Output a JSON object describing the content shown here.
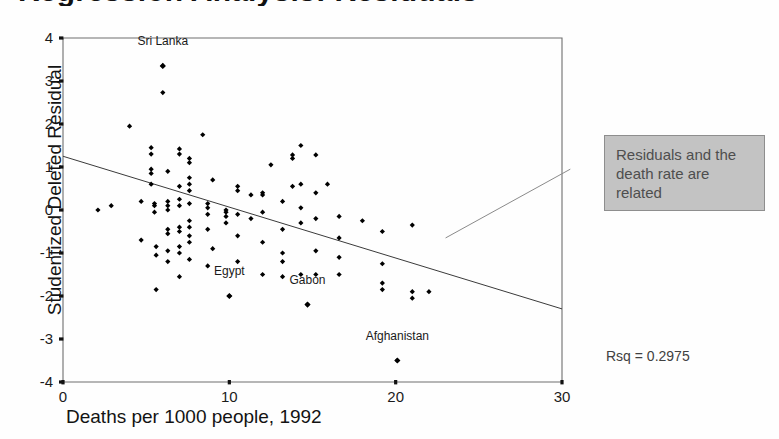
{
  "clipped_title": "Regression Analysis: Residuals",
  "axes": {
    "y_title": "Studentized Deleted Residual",
    "x_title": "Deaths per 1000 people, 1992",
    "y_ticks": [
      "4",
      "3",
      "2",
      "1",
      "0",
      "-1",
      "-2",
      "-3",
      "-4"
    ],
    "x_ticks": [
      "0",
      "10",
      "20",
      "30"
    ]
  },
  "callout": {
    "line1": "Residuals and the",
    "line2": "death rate are",
    "line3": "related",
    "bg_color": "#c3c3c3",
    "text_color": "#4e4e4e"
  },
  "statistics": {
    "rsq_label": "Rsq = 0.2975"
  },
  "chart_data": {
    "type": "scatter",
    "title": "",
    "xlabel": "Deaths per 1000 people, 1992",
    "ylabel": "Studentized Deleted Residual",
    "xlim": [
      0,
      30
    ],
    "ylim": [
      -4,
      4
    ],
    "xticks": [
      0,
      10,
      20,
      30
    ],
    "yticks": [
      -4,
      -3,
      -2,
      -1,
      0,
      1,
      2,
      3,
      4
    ],
    "grid": false,
    "legend": null,
    "marker": "diamond",
    "marker_color": "#000000",
    "marker_size": 4,
    "r_squared": 0.2975,
    "regression_line": {
      "x": [
        0,
        30
      ],
      "y": [
        1.25,
        -2.3
      ],
      "color": "#3a3a3a",
      "width": 1
    },
    "annotations": [
      {
        "text": "Sri Lanka",
        "x": 6.0,
        "y": 3.35,
        "dy": 0.55
      },
      {
        "text": "Egypt",
        "x": 10.0,
        "y": -2.0,
        "dy": 0.55
      },
      {
        "text": "Gabon",
        "x": 14.7,
        "y": -2.2,
        "dy": 0.55
      },
      {
        "text": "Afghanistan",
        "x": 20.1,
        "y": -3.5,
        "dy": 0.55
      }
    ],
    "callout_leader": {
      "x0": 23.0,
      "y0": -0.65,
      "x1": 30.5,
      "y1": 0.95
    },
    "points": [
      [
        2.1,
        0.0
      ],
      [
        2.9,
        0.1
      ],
      [
        4.0,
        1.95
      ],
      [
        4.7,
        0.2
      ],
      [
        4.7,
        -0.7
      ],
      [
        5.3,
        1.45
      ],
      [
        5.3,
        1.3
      ],
      [
        5.3,
        0.95
      ],
      [
        5.3,
        0.85
      ],
      [
        5.3,
        0.6
      ],
      [
        5.5,
        0.15
      ],
      [
        5.5,
        0.1
      ],
      [
        5.5,
        -0.05
      ],
      [
        5.6,
        -0.85
      ],
      [
        5.6,
        -1.05
      ],
      [
        5.6,
        -1.85
      ],
      [
        6.0,
        3.35
      ],
      [
        6.0,
        2.73
      ],
      [
        6.3,
        0.9
      ],
      [
        6.3,
        0.2
      ],
      [
        6.3,
        0.1
      ],
      [
        6.3,
        0.0
      ],
      [
        6.3,
        -0.45
      ],
      [
        6.3,
        -0.55
      ],
      [
        6.3,
        -0.95
      ],
      [
        6.3,
        -1.2
      ],
      [
        7.0,
        1.42
      ],
      [
        7.0,
        1.3
      ],
      [
        7.0,
        0.55
      ],
      [
        7.0,
        0.25
      ],
      [
        7.0,
        0.1
      ],
      [
        7.0,
        -0.4
      ],
      [
        7.0,
        -0.5
      ],
      [
        7.0,
        -0.85
      ],
      [
        7.0,
        -1.0
      ],
      [
        7.0,
        -1.55
      ],
      [
        7.6,
        1.2
      ],
      [
        7.6,
        1.1
      ],
      [
        7.6,
        0.75
      ],
      [
        7.6,
        0.6
      ],
      [
        7.6,
        0.45
      ],
      [
        7.6,
        0.15
      ],
      [
        7.6,
        -0.25
      ],
      [
        7.6,
        -0.4
      ],
      [
        7.6,
        -0.6
      ],
      [
        7.6,
        -0.75
      ],
      [
        7.6,
        -1.15
      ],
      [
        8.4,
        1.75
      ],
      [
        8.7,
        0.15
      ],
      [
        8.7,
        0.05
      ],
      [
        8.7,
        -0.1
      ],
      [
        8.7,
        -0.45
      ],
      [
        8.7,
        -1.3
      ],
      [
        9.0,
        0.7
      ],
      [
        9.0,
        -0.9
      ],
      [
        9.8,
        0.0
      ],
      [
        9.8,
        -0.05
      ],
      [
        9.8,
        -0.15
      ],
      [
        9.8,
        -0.3
      ],
      [
        10.0,
        -2.0
      ],
      [
        10.5,
        0.55
      ],
      [
        10.5,
        0.45
      ],
      [
        10.5,
        -0.1
      ],
      [
        10.5,
        -0.6
      ],
      [
        10.5,
        -1.2
      ],
      [
        11.3,
        0.35
      ],
      [
        11.3,
        -0.2
      ],
      [
        12.0,
        0.4
      ],
      [
        12.0,
        0.35
      ],
      [
        12.0,
        -0.05
      ],
      [
        12.0,
        -0.75
      ],
      [
        12.0,
        -1.5
      ],
      [
        12.5,
        1.05
      ],
      [
        13.2,
        0.2
      ],
      [
        13.2,
        -0.45
      ],
      [
        13.2,
        -1.0
      ],
      [
        13.2,
        -1.2
      ],
      [
        13.2,
        -1.55
      ],
      [
        13.8,
        1.28
      ],
      [
        13.8,
        1.2
      ],
      [
        13.8,
        0.55
      ],
      [
        14.3,
        1.5
      ],
      [
        14.3,
        0.6
      ],
      [
        14.3,
        0.05
      ],
      [
        14.3,
        -0.3
      ],
      [
        14.3,
        -1.5
      ],
      [
        14.7,
        -2.2
      ],
      [
        15.2,
        1.28
      ],
      [
        15.2,
        0.4
      ],
      [
        15.2,
        -0.2
      ],
      [
        15.2,
        -0.95
      ],
      [
        15.2,
        -1.5
      ],
      [
        15.9,
        0.6
      ],
      [
        16.6,
        -0.15
      ],
      [
        16.6,
        -0.65
      ],
      [
        16.6,
        -1.1
      ],
      [
        16.6,
        -1.5
      ],
      [
        18.0,
        -0.25
      ],
      [
        19.2,
        -0.5
      ],
      [
        19.2,
        -1.25
      ],
      [
        19.2,
        -1.7
      ],
      [
        19.2,
        -1.85
      ],
      [
        20.1,
        -3.5
      ],
      [
        21.0,
        -0.35
      ],
      [
        21.0,
        -1.9
      ],
      [
        21.0,
        -2.05
      ],
      [
        22.0,
        -1.9
      ]
    ]
  }
}
